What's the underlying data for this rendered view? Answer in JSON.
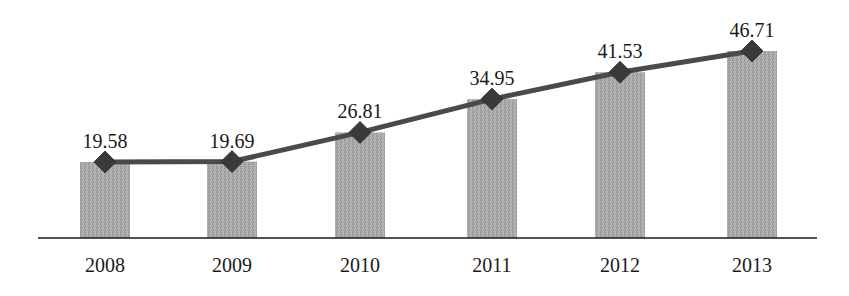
{
  "chart_data": {
    "type": "bar+line",
    "title": "",
    "xlabel": "",
    "ylabel": "",
    "categories": [
      "2008",
      "2009",
      "2010",
      "2011",
      "2012",
      "2013"
    ],
    "series": [
      {
        "name": "bars",
        "type": "bar",
        "values": [
          19.58,
          19.69,
          26.81,
          34.95,
          41.53,
          46.71
        ],
        "color": "#a8a8a8"
      },
      {
        "name": "line",
        "type": "line",
        "marker": "diamond",
        "values": [
          19.58,
          19.69,
          26.81,
          34.95,
          41.53,
          46.71
        ],
        "color": "#4a4a4a"
      }
    ],
    "data_labels": [
      "19.58",
      "19.69",
      "26.81",
      "34.95",
      "41.53",
      "46.71"
    ],
    "grid": false,
    "legend": null,
    "yaxis_visible": false
  },
  "colors": {
    "bar": "#a8a8a8",
    "line": "#4a4a4a",
    "marker": "#3a3a3a",
    "axis": "#1a1a1a",
    "text": "#1a1a1a"
  }
}
